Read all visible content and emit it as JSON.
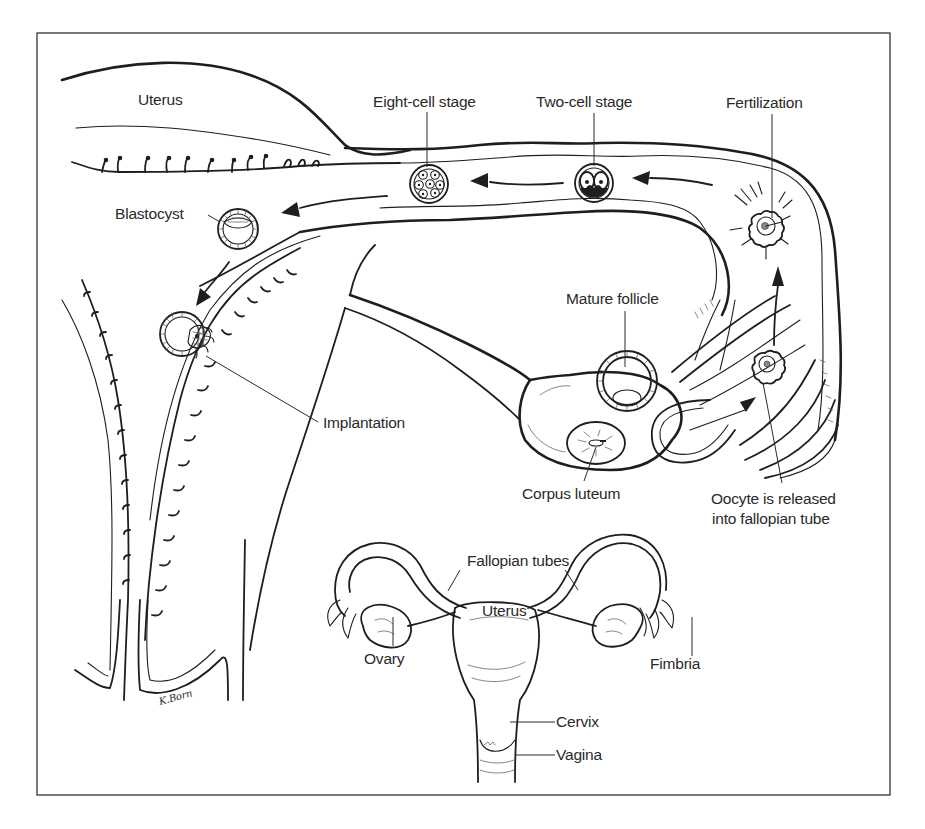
{
  "figure": {
    "frame": {
      "left": 37,
      "top": 33,
      "right": 890,
      "bottom": 795
    },
    "ink_color": "#1e1e1e",
    "background": "#ffffff",
    "signature": "K.Born"
  },
  "labels": {
    "uterus_top": "Uterus",
    "eight_cell": "Eight-cell stage",
    "two_cell": "Two-cell stage",
    "fertilization": "Fertilization",
    "blastocyst": "Blastocyst",
    "mature_follicle": "Mature follicle",
    "implantation": "Implantation",
    "corpus_luteum": "Corpus luteum",
    "oocyte_line1": "Oocyte is released",
    "oocyte_line2": "into fallopian tube",
    "fallopian_tubes": "Fallopian tubes",
    "uterus_inset": "Uterus",
    "ovary": "Ovary",
    "fimbria": "Fimbria",
    "cervix": "Cervix",
    "vagina": "Vagina"
  },
  "stages": [
    {
      "name": "Oocyte release",
      "icon": "oocyte-icon"
    },
    {
      "name": "Fertilization",
      "icon": "fertilized-egg-icon"
    },
    {
      "name": "Two-cell stage",
      "icon": "two-cell-icon"
    },
    {
      "name": "Eight-cell stage",
      "icon": "eight-cell-icon"
    },
    {
      "name": "Blastocyst",
      "icon": "blastocyst-icon"
    },
    {
      "name": "Implantation",
      "icon": "implantation-icon"
    }
  ]
}
